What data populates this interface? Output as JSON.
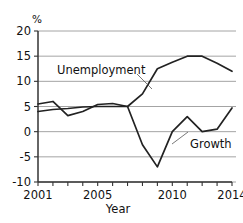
{
  "chart_data": {
    "type": "line",
    "title": "",
    "xlabel": "Year",
    "ylabel": "%",
    "unit_symbol": "%",
    "x": [
      2001,
      2002,
      2003,
      2004,
      2005,
      2006,
      2007,
      2008,
      2009,
      2010,
      2011,
      2012,
      2013,
      2014
    ],
    "xlim": [
      2001,
      2014
    ],
    "ylim": [
      -10,
      20
    ],
    "yticks": [
      -10,
      -5,
      0,
      5,
      10,
      15,
      20
    ],
    "ytick_labels": [
      "-10",
      "-5",
      "0",
      "5",
      "10",
      "15",
      "20"
    ],
    "xticks": [
      2001,
      2002,
      2003,
      2004,
      2005,
      2006,
      2007,
      2008,
      2009,
      2010,
      2011,
      2012,
      2013,
      2014
    ],
    "xtick_labels_shown": [
      "2001",
      "2005",
      "2010",
      "2014"
    ],
    "xtick_labels_shown_values": [
      2001,
      2005,
      2010,
      2014
    ],
    "grid": "horizontal",
    "legend": "inline-annotations",
    "series": [
      {
        "name": "Unemployment",
        "label": "Unemployment",
        "color": "#222222",
        "values": [
          5.5,
          6.0,
          3.2,
          4.0,
          5.4,
          5.6,
          5.0,
          7.5,
          12.5,
          13.8,
          15.0,
          15.0,
          13.6,
          12.0
        ]
      },
      {
        "name": "Growth",
        "label": "Growth",
        "color": "#222222",
        "values": [
          4.0,
          4.4,
          4.6,
          4.9,
          5.0,
          5.0,
          5.0,
          -2.6,
          -7.0,
          0.0,
          3.0,
          0.0,
          0.5,
          4.7
        ]
      }
    ],
    "annotations": [
      {
        "text": "Unemployment",
        "x": 2002.0,
        "y": 11.5
      },
      {
        "text": "Growth",
        "x": 2011.1,
        "y": -3.0
      }
    ]
  }
}
